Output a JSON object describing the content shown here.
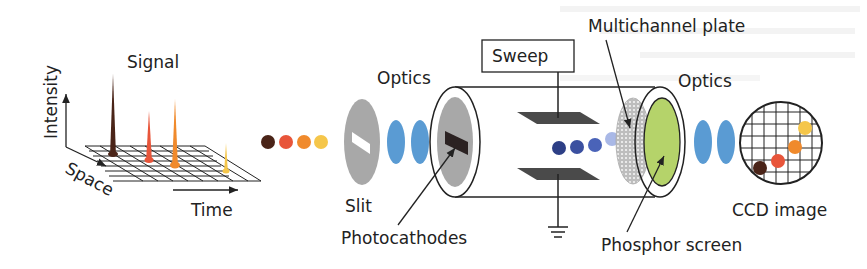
{
  "diagram": {
    "labels": {
      "signal": "Signal",
      "intensity": "Intensity",
      "space": "Space",
      "time": "Time",
      "optics_in": "Optics",
      "slit": "Slit",
      "photocathodes": "Photocathodes",
      "sweep": "Sweep",
      "multichannel_plate": "Multichannel plate",
      "optics_out": "Optics",
      "phosphor_screen": "Phosphor screen",
      "ccd_image": "CCD image"
    },
    "pulse_colors": [
      "#4a2418",
      "#e8553a",
      "#f08a2c",
      "#f5c64a"
    ],
    "electron_colors": [
      "#2d3f86",
      "#3b50a0",
      "#4a63b8",
      "#a9b8e6"
    ],
    "colors": {
      "lens": "#5a9bd3",
      "slit_plate": "#a8a8a8",
      "photocathode_bar": "#2b2222",
      "deflection_plate": "#4a4a4a",
      "phosphor": "#b5d36a",
      "mcp": "#c8c8c8"
    }
  }
}
